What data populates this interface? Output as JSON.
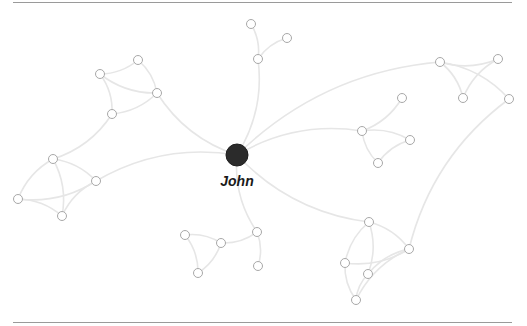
{
  "graph": {
    "title": "Social network graph",
    "center": {
      "id": "john",
      "label": "John",
      "x": 237,
      "y": 155,
      "r": 11,
      "color": "#2b2b2b"
    },
    "colors": {
      "edge": "#e6e6e6",
      "node_stroke": "#a8a8a8",
      "node_fill": "#ffffff",
      "rule": "#9a9a9a"
    },
    "node_radius": 4.5,
    "nodes": [
      {
        "id": "n1",
        "x": 251,
        "y": 24
      },
      {
        "id": "n2",
        "x": 287,
        "y": 38
      },
      {
        "id": "n3",
        "x": 258,
        "y": 59
      },
      {
        "id": "n4",
        "x": 138,
        "y": 60
      },
      {
        "id": "n5",
        "x": 100,
        "y": 74
      },
      {
        "id": "n6",
        "x": 157,
        "y": 93
      },
      {
        "id": "n7",
        "x": 112,
        "y": 114
      },
      {
        "id": "n8",
        "x": 53,
        "y": 159
      },
      {
        "id": "n9",
        "x": 96,
        "y": 181
      },
      {
        "id": "n10",
        "x": 18,
        "y": 199
      },
      {
        "id": "n11",
        "x": 62,
        "y": 216
      },
      {
        "id": "n12",
        "x": 440,
        "y": 62
      },
      {
        "id": "n13",
        "x": 498,
        "y": 59
      },
      {
        "id": "n14",
        "x": 463,
        "y": 98
      },
      {
        "id": "n15",
        "x": 509,
        "y": 99
      },
      {
        "id": "n16",
        "x": 402,
        "y": 98
      },
      {
        "id": "n17",
        "x": 362,
        "y": 131
      },
      {
        "id": "n18",
        "x": 410,
        "y": 140
      },
      {
        "id": "n19",
        "x": 378,
        "y": 163
      },
      {
        "id": "n20",
        "x": 185,
        "y": 235
      },
      {
        "id": "n21",
        "x": 221,
        "y": 243
      },
      {
        "id": "n22",
        "x": 257,
        "y": 232
      },
      {
        "id": "n23",
        "x": 198,
        "y": 273
      },
      {
        "id": "n24",
        "x": 258,
        "y": 266
      },
      {
        "id": "n25",
        "x": 369,
        "y": 222
      },
      {
        "id": "n26",
        "x": 409,
        "y": 249
      },
      {
        "id": "n27",
        "x": 345,
        "y": 263
      },
      {
        "id": "n28",
        "x": 368,
        "y": 274
      },
      {
        "id": "n29",
        "x": 356,
        "y": 300
      }
    ],
    "edges": [
      [
        "john",
        "n3"
      ],
      [
        "n1",
        "n3"
      ],
      [
        "n2",
        "n3"
      ],
      [
        "john",
        "n6"
      ],
      [
        "n5",
        "n4"
      ],
      [
        "n4",
        "n6"
      ],
      [
        "n5",
        "n6"
      ],
      [
        "n5",
        "n7"
      ],
      [
        "n7",
        "n6"
      ],
      [
        "n7",
        "n8"
      ],
      [
        "john",
        "n9"
      ],
      [
        "n8",
        "n9"
      ],
      [
        "n8",
        "n10"
      ],
      [
        "n8",
        "n11"
      ],
      [
        "n10",
        "n9"
      ],
      [
        "n10",
        "n11"
      ],
      [
        "n9",
        "n11"
      ],
      [
        "john",
        "n12"
      ],
      [
        "n12",
        "n13"
      ],
      [
        "n12",
        "n14"
      ],
      [
        "n13",
        "n14"
      ],
      [
        "n12",
        "n15"
      ],
      [
        "n15",
        "n26"
      ],
      [
        "john",
        "n17"
      ],
      [
        "n17",
        "n16"
      ],
      [
        "n17",
        "n18"
      ],
      [
        "n17",
        "n19"
      ],
      [
        "n19",
        "n18"
      ],
      [
        "john",
        "n22"
      ],
      [
        "n20",
        "n21"
      ],
      [
        "n21",
        "n22"
      ],
      [
        "n20",
        "n23"
      ],
      [
        "n23",
        "n21"
      ],
      [
        "n22",
        "n24"
      ],
      [
        "john",
        "n25"
      ],
      [
        "n25",
        "n26"
      ],
      [
        "n25",
        "n27"
      ],
      [
        "n25",
        "n28"
      ],
      [
        "n27",
        "n26"
      ],
      [
        "n28",
        "n26"
      ],
      [
        "n27",
        "n29"
      ],
      [
        "n29",
        "n26"
      ],
      [
        "n28",
        "n29"
      ]
    ]
  }
}
